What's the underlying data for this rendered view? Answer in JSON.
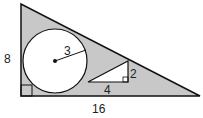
{
  "diagram": {
    "labels": {
      "left_leg": "8",
      "bottom_leg": "16",
      "circle_radius": "3",
      "small_triangle_height": "2",
      "small_triangle_base": "4"
    },
    "colors": {
      "shade": "#c8c8c8",
      "stroke": "#111111",
      "fill_white": "#ffffff"
    }
  }
}
